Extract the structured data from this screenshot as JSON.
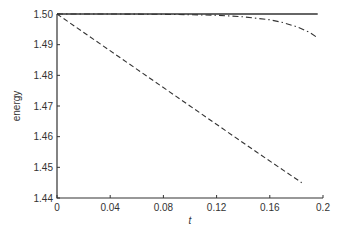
{
  "chart_data": {
    "type": "line",
    "title": "",
    "xlabel": "t",
    "ylabel": "energy",
    "xlim": [
      0,
      0.2
    ],
    "ylim": [
      1.44,
      1.5
    ],
    "xticks": [
      0,
      0.04,
      0.08,
      0.12,
      0.16,
      0.2
    ],
    "xtick_labels": [
      "0",
      "0.04",
      "0.08",
      "0.12",
      "0.16",
      "0.2"
    ],
    "yticks": [
      1.44,
      1.45,
      1.46,
      1.47,
      1.48,
      1.49,
      1.5
    ],
    "ytick_labels": [
      "1.44",
      "1.45",
      "1.46",
      "1.47",
      "1.48",
      "1.49",
      "1.50"
    ],
    "grid": false,
    "legend": null,
    "series": [
      {
        "name": "solid",
        "style": "solid",
        "color": "#333333",
        "x": [
          0,
          0.05,
          0.1,
          0.15,
          0.196
        ],
        "y": [
          1.5,
          1.5,
          1.5,
          1.5,
          1.5
        ]
      },
      {
        "name": "dashed",
        "style": "dashed",
        "color": "#333333",
        "x": [
          0,
          0.05,
          0.1,
          0.15,
          0.184
        ],
        "y": [
          1.5,
          1.485,
          1.47,
          1.455,
          1.445
        ]
      },
      {
        "name": "dash-dot",
        "style": "dashdot",
        "color": "#333333",
        "x": [
          0,
          0.04,
          0.08,
          0.12,
          0.14,
          0.16,
          0.17,
          0.18,
          0.19,
          0.196
        ],
        "y": [
          1.5,
          1.5,
          1.4999,
          1.4996,
          1.4991,
          1.4981,
          1.4972,
          1.4959,
          1.494,
          1.4922
        ]
      }
    ]
  }
}
